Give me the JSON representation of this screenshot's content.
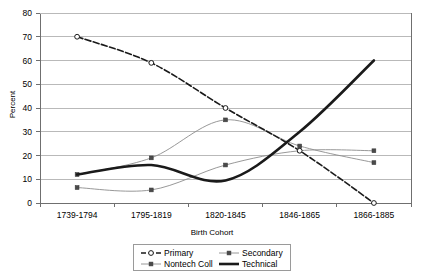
{
  "chart_data": {
    "type": "line",
    "title": "",
    "xlabel": "Birth Cohort",
    "ylabel": "Percent",
    "categories": [
      "1739-1794",
      "1795-1819",
      "1820-1845",
      "1846-1865",
      "1866-1885"
    ],
    "ylim": [
      0,
      80
    ],
    "ytick_step": 10,
    "yticks": [
      "0",
      "10",
      "20",
      "30",
      "40",
      "50",
      "60",
      "70",
      "80"
    ],
    "grid": "horizontal",
    "legend_position": "bottom-center",
    "series": [
      {
        "name": "Primary",
        "values": [
          70,
          59,
          40,
          22,
          0
        ],
        "color": "#1a1a1a",
        "line_style": "dashed",
        "marker": "open-circle",
        "line_width": 1.6
      },
      {
        "name": "Secondary",
        "values": [
          12,
          19,
          35,
          24,
          17
        ],
        "color": "#8c8c8c",
        "line_style": "solid",
        "marker": "filled-square",
        "line_width": 0.9
      },
      {
        "name": "Nontech Coll",
        "values": [
          6.5,
          5.5,
          16,
          22,
          22
        ],
        "color": "#8c8c8c",
        "line_style": "solid",
        "marker": "filled-square",
        "line_width": 0.9
      },
      {
        "name": "Technical",
        "values": [
          12,
          16,
          9.5,
          30,
          60
        ],
        "color": "#1a1a1a",
        "line_style": "solid",
        "marker": "none",
        "line_width": 2.6
      }
    ]
  },
  "axis": {
    "ylabel": "Percent",
    "xlabel": "Birth Cohort",
    "yticks": [
      "80",
      "70",
      "60",
      "50",
      "40",
      "30",
      "20",
      "10",
      "0"
    ],
    "xticks": [
      "1739-1794",
      "1795-1819",
      "1820-1845",
      "1846-1865",
      "1866-1885"
    ]
  },
  "legend": {
    "entries": [
      {
        "label": "Primary"
      },
      {
        "label": "Secondary"
      },
      {
        "label": "Nontech Coll"
      },
      {
        "label": "Technical"
      }
    ]
  },
  "colors": {
    "plot_border": "#6f6f6f",
    "gridline": "#b9b9b9",
    "dark_series": "#1a1a1a",
    "light_series": "#8c8c8c",
    "background": "#ffffff"
  }
}
